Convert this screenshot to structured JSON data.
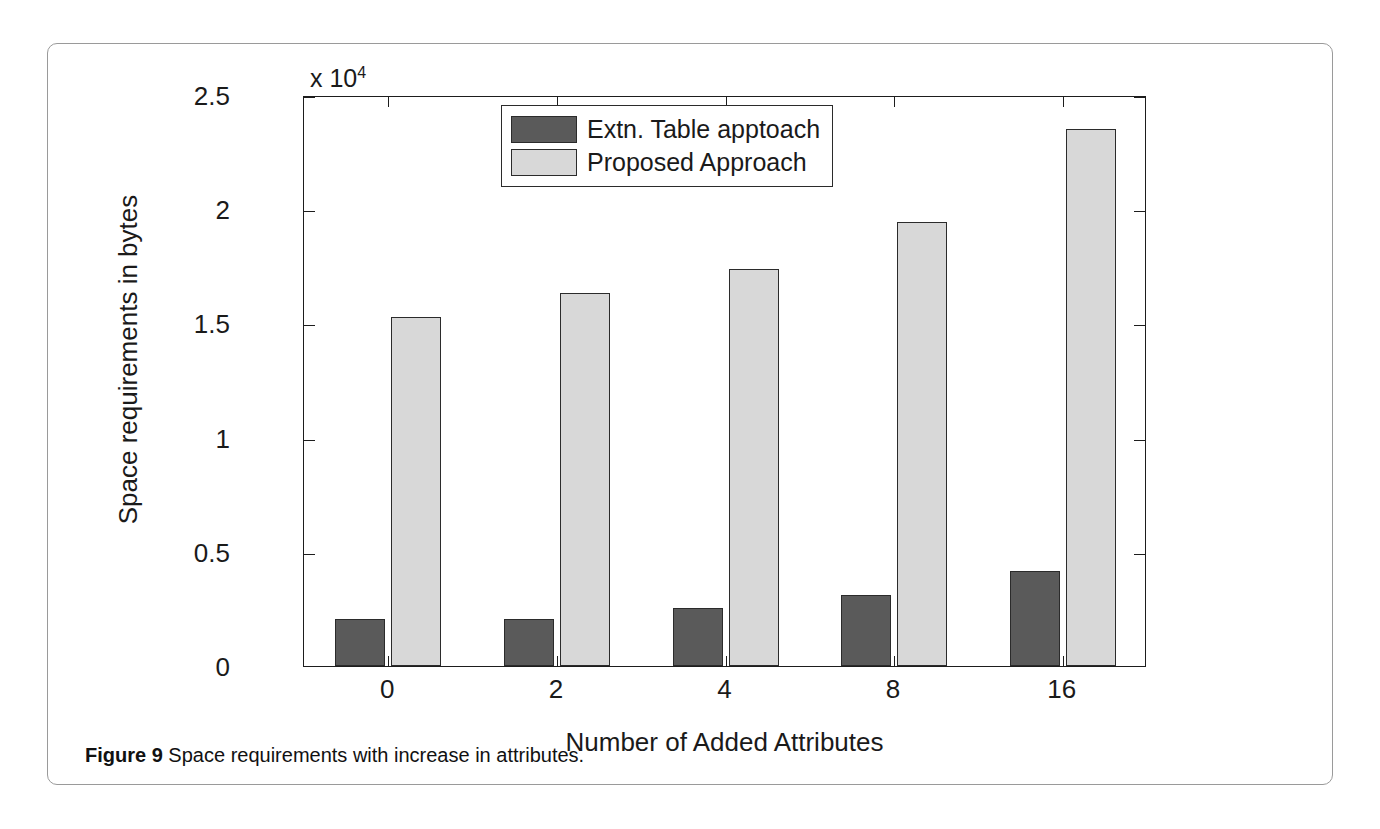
{
  "figure": {
    "caption_label": "Figure 9",
    "caption_text": "Space requirements with increase in attributes."
  },
  "chart_data": {
    "type": "bar",
    "title": "",
    "xlabel": "Number of Added Attributes",
    "ylabel": "Space requirements in bytes",
    "y_multiplier_text": "x 10",
    "y_multiplier_exponent": "4",
    "y_multiplier": 10000,
    "categories": [
      "0",
      "2",
      "4",
      "8",
      "16"
    ],
    "ylim": [
      0,
      25000
    ],
    "yticks": [
      0,
      5000,
      10000,
      15000,
      20000,
      25000
    ],
    "ytick_labels": [
      "0",
      "0.5",
      "1",
      "1.5",
      "2",
      "2.5"
    ],
    "grid": false,
    "legend_position": "upper center",
    "series": [
      {
        "name": "Extn. Table apptoach",
        "color": "#5a5a5a",
        "values": [
          2050,
          2050,
          2550,
          3100,
          4150
        ]
      },
      {
        "name": "Proposed Approach",
        "color": "#d8d8d8",
        "values": [
          15300,
          16350,
          17400,
          19450,
          23500
        ]
      }
    ]
  }
}
